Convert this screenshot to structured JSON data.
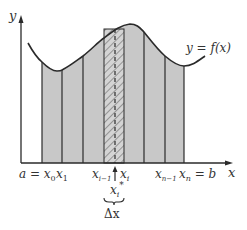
{
  "diagram": {
    "colors": {
      "fill": "#c8c8c8",
      "stroke": "#2a2a2a",
      "background": "#ffffff"
    },
    "axes": {
      "x_label": "x",
      "y_label": "y"
    },
    "curve_label": "y = f(x)",
    "tick_labels": {
      "a_eq_x0": "a = x",
      "x0_sub": "0",
      "x1": "x",
      "x1_sub": "1",
      "xim1": "x",
      "xim1_sub": "i−1",
      "xi": "x",
      "xi_sub": "i",
      "xnm1": "x",
      "xnm1_sub": "n−1",
      "xn_eq_b": "x",
      "xn_sub": "n",
      "xn_b": " = b"
    },
    "sample_point": {
      "label": "x",
      "sub": "i",
      "sup": "*"
    },
    "width_label": "Δx"
  }
}
